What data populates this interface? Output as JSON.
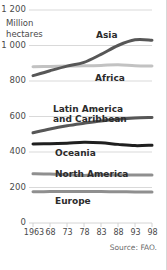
{
  "chart_data": {
    "type": "line",
    "title": "",
    "subtitle": "",
    "unit_label": "Million\nhectares",
    "unit_label_line1": "Million",
    "unit_label_line2": "hectares",
    "xlabel": "",
    "ylabel": "Million hectares",
    "source": "Source: FAO.",
    "grid": true,
    "legend_position": "inline-labels",
    "xlim": [
      1963,
      1998
    ],
    "ylim": [
      0,
      1200
    ],
    "yticks": [
      0,
      200,
      400,
      600,
      800,
      1000,
      1200
    ],
    "ytick_labels": [
      "0",
      "200",
      "400",
      "600",
      "800",
      "1 000",
      "1 200"
    ],
    "xticks": [
      1963,
      1968,
      1973,
      1978,
      1983,
      1988,
      1993,
      1998
    ],
    "xtick_labels": [
      "1963",
      "68",
      "73",
      "78",
      "83",
      "88",
      "93",
      "98"
    ],
    "x": [
      1963,
      1968,
      1973,
      1978,
      1983,
      1988,
      1993,
      1998
    ],
    "series": [
      {
        "name": "Asia",
        "color": "#575757",
        "width": 3.0,
        "values": [
          830,
          858,
          884,
          905,
          950,
          1000,
          1032,
          1030
        ],
        "label_x": 1985,
        "label_y": 1075
      },
      {
        "name": "Africa",
        "color": "#c2c2c2",
        "width": 3.0,
        "values": [
          880,
          882,
          884,
          886,
          888,
          892,
          886,
          884
        ],
        "label_x": 1985,
        "label_y": 820
      },
      {
        "name": "Latin America and Caribbean",
        "color": "#575757",
        "width": 3.0,
        "values": [
          508,
          530,
          548,
          562,
          575,
          585,
          592,
          595
        ],
        "label_x": 1975,
        "label_y": 690,
        "label_line1": "Latin America",
        "label_line2": "and Caribbean"
      },
      {
        "name": "Oceania",
        "color": "#1f1f1f",
        "width": 3.0,
        "values": [
          445,
          447,
          450,
          455,
          452,
          443,
          436,
          438
        ],
        "label_x": 1975,
        "label_y": 398
      },
      {
        "name": "North America",
        "color": "#8f8f8f",
        "width": 3.0,
        "values": [
          278,
          276,
          272,
          268,
          272,
          270,
          270,
          270
        ],
        "label_x": 1975,
        "label_y": 305
      },
      {
        "name": "Europe",
        "color": "#8f8f8f",
        "width": 3.0,
        "values": [
          176,
          177,
          178,
          178,
          177,
          176,
          175,
          175
        ],
        "label_x": 1975,
        "label_y": 138
      }
    ]
  },
  "axis": {
    "y_labels": [
      "1 200",
      "1 000",
      "800",
      "600",
      "400",
      "200",
      "0"
    ],
    "x_labels": [
      "1963",
      "68",
      "73",
      "78",
      "83",
      "88",
      "93",
      "98"
    ]
  },
  "labels": {
    "unit_line1": "Million",
    "unit_line2": "hectares",
    "asia": "Asia",
    "africa": "Africa",
    "latin_line1": "Latin America",
    "latin_line2": "and Caribbean",
    "oceania": "Oceania",
    "north_america": "North America",
    "europe": "Europe",
    "source": "Source: FAO."
  },
  "colors": {
    "grid": "#cfcfcf",
    "text": "#4a4a4a",
    "dark_series": "#575757",
    "black_series": "#1f1f1f",
    "light_series": "#c2c2c2",
    "mid_series": "#8f8f8f",
    "border": "#d8d8d8"
  }
}
